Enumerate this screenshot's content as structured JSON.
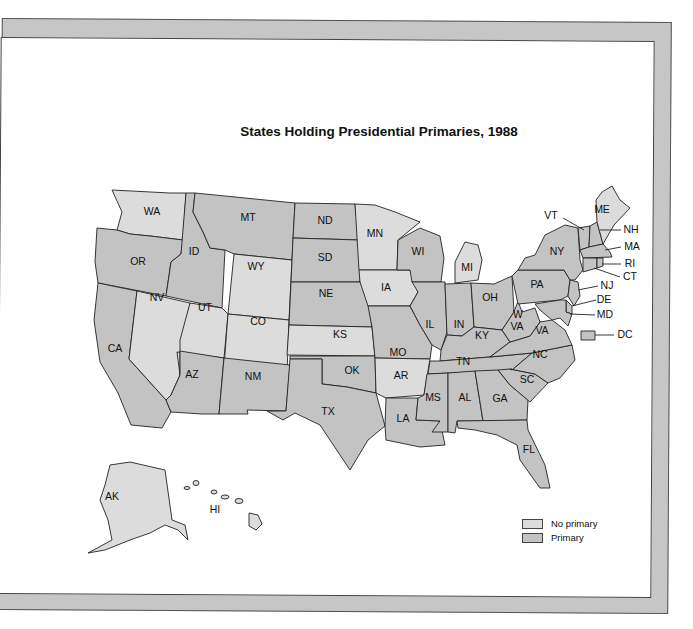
{
  "chart_data": {
    "type": "choropleth",
    "title": "States Holding Presidential Primaries, 1988",
    "legend": {
      "placement": "bottom-right",
      "entries": [
        {
          "key": "none",
          "label": "No primary",
          "color": "#dcdcdc"
        },
        {
          "key": "primary",
          "label": "Primary",
          "color": "#c3c3c3"
        }
      ]
    },
    "states": {
      "WA": "none",
      "OR": "primary",
      "CA": "primary",
      "ID": "primary",
      "NV": "none",
      "MT": "primary",
      "WY": "none",
      "UT": "none",
      "CO": "none",
      "AZ": "primary",
      "NM": "primary",
      "ND": "primary",
      "SD": "primary",
      "NE": "primary",
      "KS": "none",
      "OK": "primary",
      "TX": "primary",
      "MN": "none",
      "IA": "none",
      "MO": "primary",
      "AR": "none",
      "LA": "primary",
      "WI": "primary",
      "IL": "primary",
      "MI": "none",
      "IN": "primary",
      "OH": "primary",
      "KY": "primary",
      "TN": "primary",
      "MS": "primary",
      "AL": "primary",
      "GA": "primary",
      "FL": "primary",
      "SC": "primary",
      "NC": "primary",
      "VA": "primary",
      "WV": "primary",
      "PA": "primary",
      "NY": "primary",
      "VT": "primary",
      "NH": "primary",
      "ME": "none",
      "MA": "primary",
      "RI": "primary",
      "CT": "primary",
      "NJ": "primary",
      "DE": "primary",
      "MD": "primary",
      "DC": "primary",
      "AK": "none",
      "HI": "none"
    },
    "labels": {
      "WA": "WA",
      "OR": "OR",
      "CA": "CA",
      "ID": "ID",
      "NV": "NV",
      "MT": "MT",
      "WY": "WY",
      "UT": "UT",
      "CO": "CO",
      "AZ": "AZ",
      "NM": "NM",
      "ND": "ND",
      "SD": "SD",
      "NE": "NE",
      "KS": "KS",
      "OK": "OK",
      "TX": "TX",
      "MN": "MN",
      "IA": "IA",
      "MO": "MO",
      "AR": "AR",
      "LA": "LA",
      "WI": "WI",
      "IL": "IL",
      "MI": "MI",
      "IN": "IN",
      "OH": "OH",
      "KY": "KY",
      "TN": "TN",
      "MS": "MS",
      "AL": "AL",
      "GA": "GA",
      "FL": "FL",
      "SC": "SC",
      "NC": "NC",
      "VA": "VA",
      "WV1": "W",
      "WV2": "VA",
      "PA": "PA",
      "NY": "NY",
      "VT": "VT",
      "NH": "NH",
      "ME": "ME",
      "MA": "MA",
      "RI": "RI",
      "CT": "CT",
      "NJ": "NJ",
      "DE": "DE",
      "MD": "MD",
      "DC": "DC",
      "AK": "AK",
      "HI": "HI"
    }
  }
}
